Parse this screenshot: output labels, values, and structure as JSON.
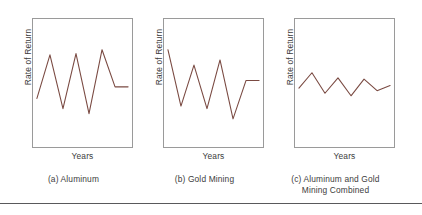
{
  "figure": {
    "background_color": "#ffffff",
    "line_color": "#7a4a42",
    "frame_color": "#9a9a9a",
    "rule_color": "#59595b"
  },
  "panels": [
    {
      "id": "a",
      "caption_line1": "(a) Aluminum",
      "caption_line2": "",
      "xlabel": "Years",
      "ylabel": "Rate of Return"
    },
    {
      "id": "b",
      "caption_line1": "(b) Gold Mining",
      "caption_line2": "",
      "xlabel": "Years",
      "ylabel": "Rate of Return"
    },
    {
      "id": "c",
      "caption_line1": "(c) Aluminum and Gold",
      "caption_line2": "Mining Combined",
      "xlabel": "Years",
      "ylabel": "Rate of Return"
    }
  ],
  "chart_data": [
    {
      "type": "line",
      "title": "(a) Aluminum",
      "xlabel": "Years",
      "ylabel": "Rate of Return",
      "grid": false,
      "legend": "none",
      "axis_ticks": false,
      "x": [
        0,
        1,
        2,
        3,
        4,
        5,
        6,
        7
      ],
      "values": [
        38,
        72,
        30,
        73,
        26,
        76,
        47,
        47
      ],
      "xlim": [
        0,
        7
      ],
      "ylim": [
        0,
        100
      ],
      "series": [
        {
          "name": "Aluminum",
          "color": "#7a4a42",
          "values": [
            38,
            72,
            30,
            73,
            26,
            76,
            47,
            47
          ]
        }
      ]
    },
    {
      "type": "line",
      "title": "(b) Gold Mining",
      "xlabel": "Years",
      "ylabel": "Rate of Return",
      "grid": false,
      "legend": "none",
      "axis_ticks": false,
      "x": [
        0,
        1,
        2,
        3,
        4,
        5,
        6,
        7
      ],
      "values": [
        76,
        32,
        64,
        30,
        68,
        22,
        52,
        52
      ],
      "xlim": [
        0,
        7
      ],
      "ylim": [
        0,
        100
      ],
      "series": [
        {
          "name": "Gold Mining",
          "color": "#7a4a42",
          "values": [
            76,
            32,
            64,
            30,
            68,
            22,
            52,
            52
          ]
        }
      ]
    },
    {
      "type": "line",
      "title": "(c) Aluminum and Gold Mining Combined",
      "xlabel": "Years",
      "ylabel": "Rate of Return",
      "grid": false,
      "legend": "none",
      "axis_ticks": false,
      "x": [
        0,
        1,
        2,
        3,
        4,
        5,
        6,
        7
      ],
      "values": [
        46,
        58,
        42,
        54,
        40,
        53,
        44,
        48
      ],
      "xlim": [
        0,
        7
      ],
      "ylim": [
        0,
        100
      ],
      "series": [
        {
          "name": "Aluminum and Gold Mining Combined",
          "color": "#7a4a42",
          "values": [
            46,
            58,
            42,
            54,
            40,
            53,
            44,
            48
          ]
        }
      ]
    }
  ]
}
